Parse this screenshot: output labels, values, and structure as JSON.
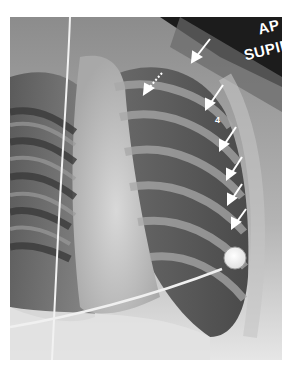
{
  "image": {
    "type": "chest radiograph",
    "projection_label": "AP",
    "position_label": "SUPINE",
    "rib_number_label": "4",
    "annotations": {
      "solid_arrows": 6,
      "dashed_arrows": 1,
      "arrow_color": "#ffffff"
    },
    "devices": [
      "central line",
      "ECG electrode with lead wire"
    ]
  },
  "colors": {
    "background": "#ffffff",
    "dark_soft_tissue": "#1a1a1a",
    "lung_field": "#6e6e6e",
    "mediastinum": "#c8c8c8",
    "abdomen": "#e4e4e4"
  }
}
